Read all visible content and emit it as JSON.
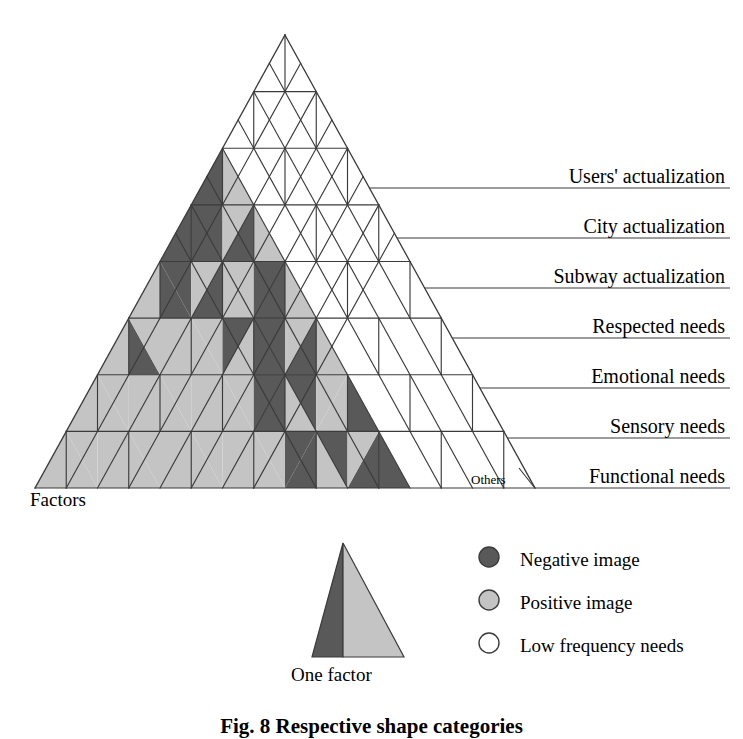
{
  "figure": {
    "caption": "Fig. 8   Respective shape categories",
    "axis_label_factors": "Factors",
    "others_label": "Others"
  },
  "rows": [
    {
      "label": "Users' actualization",
      "y": 188
    },
    {
      "label": "City actualization",
      "y": 238
    },
    {
      "label": "Subway actualization",
      "y": 288
    },
    {
      "label": "Respected needs",
      "y": 338
    },
    {
      "label": "Emotional needs",
      "y": 388
    },
    {
      "label": "Sensory needs",
      "y": 438
    },
    {
      "label": "Functional needs",
      "y": 488
    }
  ],
  "legend": {
    "one_factor_label": "One factor",
    "items": [
      {
        "key": "negative",
        "label": "Negative image",
        "swatch": "filled-dark-circle",
        "color": "#595959"
      },
      {
        "key": "positive",
        "label": "Positive image",
        "swatch": "filled-light-circle",
        "color": "#c4c4c4"
      },
      {
        "key": "low",
        "label": "Low frequency needs",
        "swatch": "empty-circle",
        "color": "#ffffff"
      }
    ]
  },
  "colors": {
    "negative": "#595959",
    "positive": "#c4c4c4",
    "low": "#ffffff",
    "stroke": "#3b3b3b",
    "text": "#000000"
  },
  "chart_data": {
    "type": "triangle-matrix",
    "title": "Respective shape categories",
    "xlabel": "Factors",
    "ylabel": "",
    "levels": [
      "Users' actualization",
      "City actualization",
      "Subway actualization",
      "Respected needs",
      "Emotional needs",
      "Sensory needs",
      "Functional needs"
    ],
    "legend_entries": [
      "Negative image",
      "Positive image",
      "Low frequency needs"
    ],
    "legend_position": "bottom-right",
    "grid": true,
    "geometry": {
      "apex": [
        285,
        35
      ],
      "base_left": [
        35,
        488
      ],
      "base_right": [
        535,
        488
      ],
      "rows": 7,
      "row_height": 50,
      "cell_half_width": 25
    },
    "cells": [
      {
        "row": 1,
        "up": [
          "low"
        ]
      },
      {
        "row": 1,
        "down": []
      },
      {
        "row": 2,
        "up": [
          "low",
          "low"
        ]
      },
      {
        "row": 2,
        "down": [
          "low"
        ]
      },
      {
        "row": 3,
        "up": [
          "neg|pos",
          "low",
          "low"
        ]
      },
      {
        "row": 3,
        "down": [
          "low",
          "low"
        ]
      },
      {
        "row": 4,
        "up": [
          "neg|neg",
          "neg|pos",
          "low",
          "low"
        ]
      },
      {
        "row": 4,
        "down": [
          "neg|pos",
          "low",
          "low"
        ]
      },
      {
        "row": 5,
        "up": [
          "pos|neg",
          "neg|pos",
          "neg|pos",
          "low",
          "low"
        ]
      },
      {
        "row": 5,
        "down": [
          "neg|pos",
          "pos|neg",
          "low",
          "low"
        ]
      },
      {
        "row": 6,
        "up": [
          "pos|neg",
          "pos|pos",
          "pos|neg",
          "neg|pos",
          "low",
          "low"
        ]
      },
      {
        "row": 6,
        "down": [
          "pos|pos",
          "pos|neg",
          "neg|pos",
          "low",
          "low"
        ]
      },
      {
        "row": 7,
        "up": [
          "pos|pos",
          "pos|pos",
          "pos|pos",
          "neg|pos",
          "pos|neg",
          "low",
          "low"
        ]
      },
      {
        "row": 7,
        "down": [
          "pos|pos",
          "pos|pos",
          "pos|neg",
          "neg|pos",
          "low",
          "low"
        ]
      },
      {
        "row": 8,
        "up": [
          "pos|pos",
          "pos|pos",
          "pos|pos",
          "pos|pos",
          "neg|pos",
          "neg|neg",
          "low",
          "low"
        ]
      },
      {
        "row": 8,
        "down": [
          "pos|pos",
          "pos|pos",
          "pos|pos",
          "pos|neg",
          "neg|pos",
          "low",
          "low"
        ]
      }
    ]
  }
}
